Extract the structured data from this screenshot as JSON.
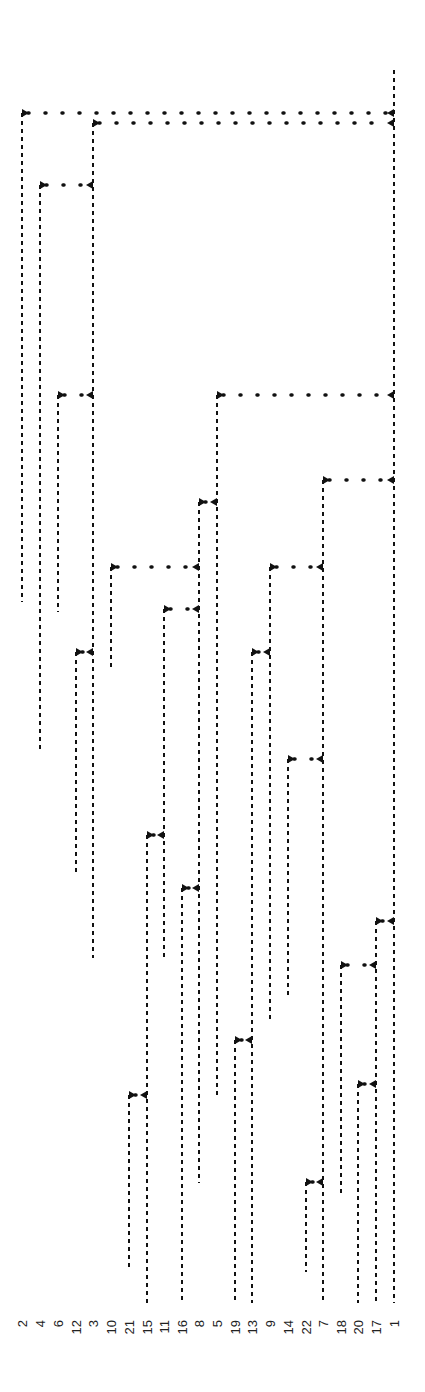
{
  "chart_data": {
    "type": "dendrogram",
    "orientation": "rotated-90",
    "title": "",
    "line_style": "dashed",
    "line_color": "#111111",
    "leaves": [
      {
        "label": "2",
        "x": 22,
        "end_y": 602
      },
      {
        "label": "4",
        "x": 40,
        "end_y": 752
      },
      {
        "label": "6",
        "x": 58,
        "end_y": 612
      },
      {
        "label": "12",
        "x": 76,
        "end_y": 872
      },
      {
        "label": "3",
        "x": 93,
        "end_y": 958
      },
      {
        "label": "10",
        "x": 111,
        "end_y": 667
      },
      {
        "label": "21",
        "x": 129,
        "end_y": 1270
      },
      {
        "label": "15",
        "x": 147,
        "end_y": 1303
      },
      {
        "label": "11",
        "x": 164,
        "end_y": 958
      },
      {
        "label": "16",
        "x": 182,
        "end_y": 1303
      },
      {
        "label": "8",
        "x": 199,
        "end_y": 1183
      },
      {
        "label": "5",
        "x": 217,
        "end_y": 1098
      },
      {
        "label": "19",
        "x": 235,
        "end_y": 1303
      },
      {
        "label": "13",
        "x": 252,
        "end_y": 1303
      },
      {
        "label": "9",
        "x": 270,
        "end_y": 1020
      },
      {
        "label": "14",
        "x": 288,
        "end_y": 998
      },
      {
        "label": "22",
        "x": 306,
        "end_y": 1272
      },
      {
        "label": "7",
        "x": 323,
        "end_y": 1303
      },
      {
        "label": "18",
        "x": 341,
        "end_y": 1195
      },
      {
        "label": "20",
        "x": 358,
        "end_y": 1303
      },
      {
        "label": "17",
        "x": 376,
        "end_y": 1303
      },
      {
        "label": "1",
        "x": 394,
        "end_y": 1303
      }
    ],
    "merges": [
      {
        "left": "2",
        "right": "1",
        "x1": 22,
        "x2": 394,
        "y": 113
      },
      {
        "left": "3",
        "right": "1",
        "x1": 93,
        "x2": 394,
        "y": 123
      },
      {
        "left": "4",
        "right": "3",
        "x1": 40,
        "x2": 93,
        "y": 185
      },
      {
        "left": "6",
        "right": "3",
        "x1": 58,
        "x2": 93,
        "y": 395
      },
      {
        "left": "5",
        "right": "1",
        "x1": 217,
        "x2": 394,
        "y": 395
      },
      {
        "left": "7",
        "right": "1",
        "x1": 323,
        "x2": 394,
        "y": 480
      },
      {
        "left": "8",
        "right": "5",
        "x1": 199,
        "x2": 217,
        "y": 502
      },
      {
        "left": "10",
        "right": "8",
        "x1": 111,
        "x2": 199,
        "y": 567
      },
      {
        "left": "9",
        "right": "7",
        "x1": 270,
        "x2": 323,
        "y": 567
      },
      {
        "left": "11",
        "right": "8",
        "x1": 164,
        "x2": 199,
        "y": 609
      },
      {
        "left": "12",
        "right": "3",
        "x1": 76,
        "x2": 93,
        "y": 652
      },
      {
        "left": "13",
        "right": "9",
        "x1": 252,
        "x2": 270,
        "y": 652
      },
      {
        "left": "14",
        "right": "7",
        "x1": 288,
        "x2": 323,
        "y": 759
      },
      {
        "left": "15",
        "right": "11",
        "x1": 147,
        "x2": 164,
        "y": 835
      },
      {
        "left": "16",
        "right": "8",
        "x1": 182,
        "x2": 199,
        "y": 888
      },
      {
        "left": "17",
        "right": "1",
        "x1": 376,
        "x2": 394,
        "y": 921
      },
      {
        "left": "18",
        "right": "17",
        "x1": 341,
        "x2": 376,
        "y": 965
      },
      {
        "left": "19",
        "right": "13",
        "x1": 235,
        "x2": 252,
        "y": 1040
      },
      {
        "left": "20",
        "right": "17",
        "x1": 358,
        "x2": 376,
        "y": 1084
      },
      {
        "left": "21",
        "right": "15",
        "x1": 129,
        "x2": 147,
        "y": 1095
      },
      {
        "left": "22",
        "right": "7",
        "x1": 306,
        "x2": 323,
        "y": 1182
      }
    ],
    "root": {
      "x": 394,
      "top_y": 70
    },
    "leaf_order": [
      "2",
      "4",
      "6",
      "12",
      "3",
      "10",
      "21",
      "15",
      "11",
      "16",
      "8",
      "5",
      "19",
      "13",
      "9",
      "14",
      "22",
      "7",
      "18",
      "20",
      "17",
      "1"
    ]
  }
}
